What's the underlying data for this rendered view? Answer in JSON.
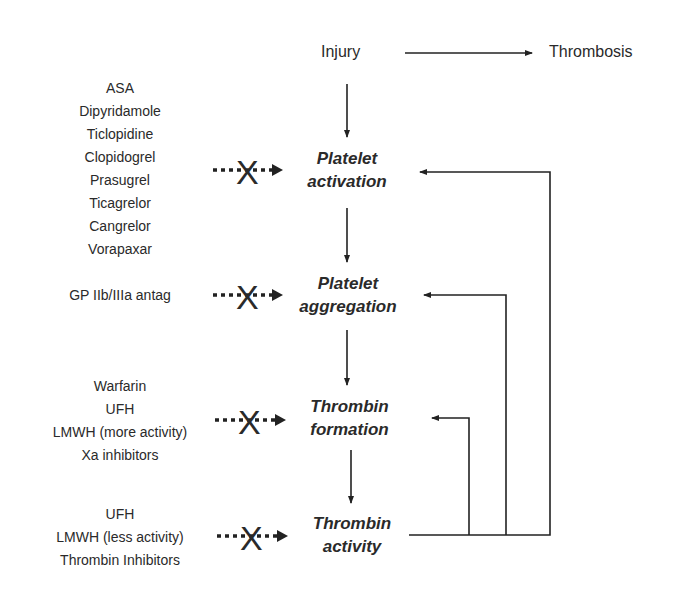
{
  "header": {
    "injury": "Injury",
    "thrombosis": "Thrombosis"
  },
  "nodes": [
    {
      "line1": "Platelet",
      "line2": "activation"
    },
    {
      "line1": "Platelet",
      "line2": "aggregation"
    },
    {
      "line1": "Thrombin",
      "line2": "formation"
    },
    {
      "line1": "Thrombin",
      "line2": "activity"
    }
  ],
  "drug_groups": [
    {
      "items": [
        "ASA",
        "Dipyridamole",
        "Ticlopidine",
        "Clopidogrel",
        "Prasugrel",
        "Ticagrelor",
        "Cangrelor",
        "Vorapaxar"
      ]
    },
    {
      "items": [
        "GP IIb/IIIa antag"
      ]
    },
    {
      "items": [
        "Warfarin",
        "UFH",
        "LMWH (more activity)",
        "Xa inhibitors"
      ]
    },
    {
      "items": [
        "UFH",
        "LMWH (less activity)",
        "Thrombin Inhibitors"
      ]
    }
  ],
  "inhibit_symbol": "X"
}
